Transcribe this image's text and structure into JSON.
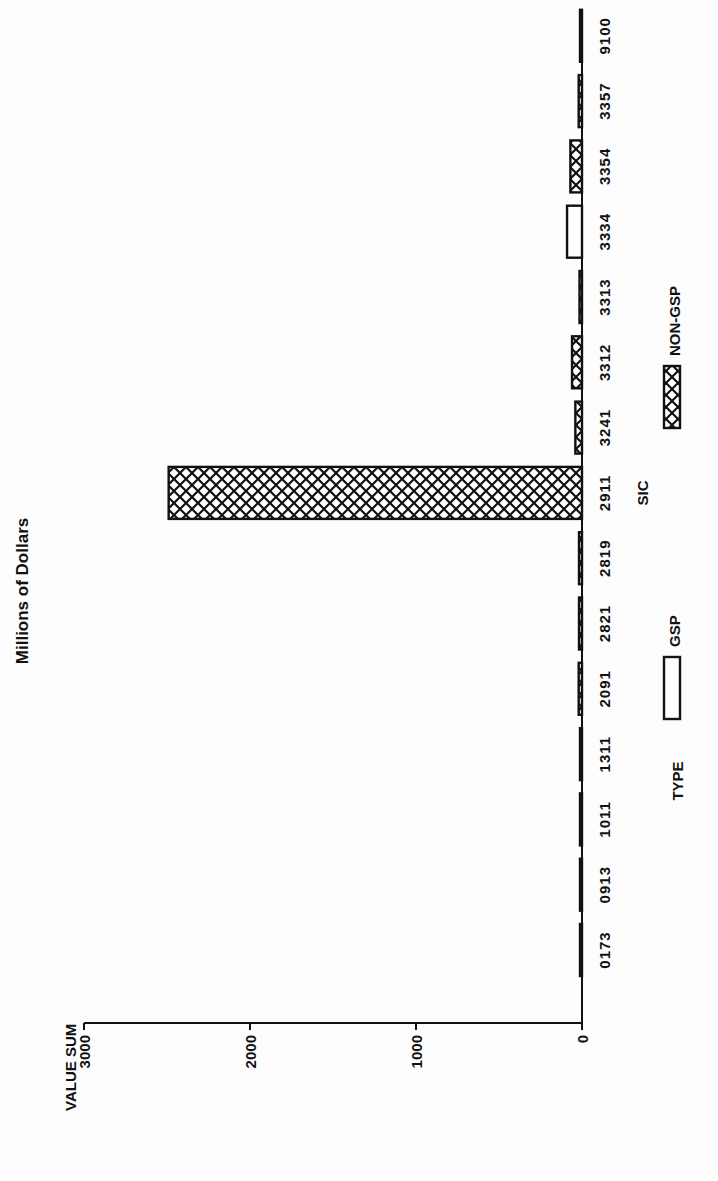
{
  "chart_data": {
    "type": "bar",
    "title": "Millions of Dollars",
    "xlabel": "SIC",
    "ylabel": "VALUE SUM",
    "ylim": [
      0,
      3000
    ],
    "yticks": [
      0,
      1000,
      2000,
      3000
    ],
    "grid": false,
    "categories": [
      "0173",
      "0913",
      "1011",
      "1311",
      "2091",
      "2821",
      "2819",
      "2911",
      "3241",
      "3312",
      "3313",
      "3334",
      "3354",
      "3357",
      "9100"
    ],
    "series": [
      {
        "name": "GSP",
        "pattern": "none",
        "values": [
          0,
          0,
          0,
          0,
          0,
          0,
          0,
          0,
          0,
          0,
          0,
          90,
          0,
          0,
          0
        ]
      },
      {
        "name": "NON-GSP",
        "pattern": "crosshatch",
        "values": [
          5,
          5,
          5,
          3,
          20,
          18,
          18,
          2490,
          40,
          60,
          15,
          0,
          70,
          20,
          3
        ]
      }
    ],
    "legend": {
      "title": "TYPE",
      "position": "bottom",
      "entries": [
        "GSP",
        "NON-GSP"
      ]
    },
    "orientation_note": "page rotated 90 degrees counter-clockwise"
  },
  "colors": {
    "ink": "#111111",
    "paper": "#fdfdfd"
  }
}
